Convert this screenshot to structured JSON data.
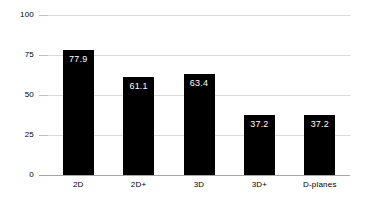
{
  "chart_data": {
    "type": "bar",
    "title": "",
    "subtitle": "",
    "xlabel": "",
    "ylabel": "",
    "categories": [
      "2D",
      "2D+",
      "3D",
      "3D+",
      "D-planes"
    ],
    "values": [
      77.9,
      61.1,
      63.4,
      37.2,
      37.2
    ],
    "value_labels": [
      "77.9",
      "61.1",
      "63.4",
      "37.2",
      "37.2"
    ],
    "yticks": [
      0,
      25,
      50,
      75,
      100
    ],
    "ytick_labels": [
      "0",
      "25",
      "50",
      "75",
      "100"
    ],
    "ylim": [
      0,
      100
    ],
    "grid": true,
    "grid_axis": "y",
    "legend": false,
    "legend_position": "none",
    "series": [
      {
        "name": "",
        "values": [
          77.9,
          61.1,
          63.4,
          37.2,
          37.2
        ]
      }
    ],
    "colors": {
      "bar_fill": "#000000",
      "value_label_text": "#ffffff",
      "gridline": "#d9d9d9",
      "axis_line": "#a6a6a6",
      "tick_text": "#000000",
      "background": "#ffffff"
    }
  }
}
